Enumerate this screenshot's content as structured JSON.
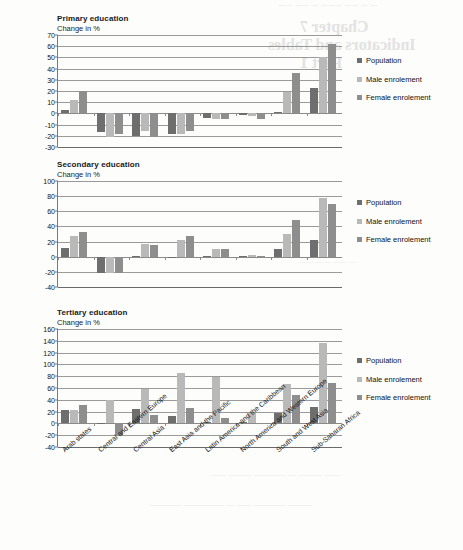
{
  "bleed_text": {
    "top_strip": "— — —— ——— — —— ——",
    "line1": "Chapter 7",
    "line2": "Indicators and Tables",
    "line3": "Part 1",
    "middle": "— —— — — ——",
    "bottom1": "—— ——— — ———— ——— ——",
    "bottom2": "——— ———— —— — ————— ————"
  },
  "legend": {
    "items": [
      {
        "label": "Population",
        "color": "#6e6e6e"
      },
      {
        "label": "Male enrolement",
        "color": "#b9b9b9"
      },
      {
        "label": "Female enrolement",
        "color": "#8e8e8e"
      }
    ]
  },
  "categories": [
    "Arab states",
    "Central and Eastern Europe",
    "Central Asia",
    "East Asia and the Pacific",
    "Latin America and the Caribbean",
    "North America and Western Europe",
    "South and West Asia",
    "Sub-Saharan Africa"
  ],
  "chart_data": [
    {
      "type": "bar",
      "title": "Primary education",
      "subtitle": "Change in %",
      "xlabel": "",
      "ylabel": "Change in %",
      "ylim": [
        -30,
        70
      ],
      "yticks": [
        70,
        60,
        50,
        40,
        30,
        20,
        10,
        0,
        -10,
        -20,
        -30
      ],
      "grid": true,
      "legend_position": "right",
      "categories": [
        "Arab states",
        "Central and Eastern Europe",
        "Central Asia",
        "East Asia and the Pacific",
        "Latin America and the Caribbean",
        "North America and Western Europe",
        "South and West Asia",
        "Sub-Saharan Africa"
      ],
      "series": [
        {
          "name": "Population",
          "values": [
            3,
            -17,
            -20,
            -18,
            -4,
            -1,
            1,
            23
          ]
        },
        {
          "name": "Male enrolement",
          "values": [
            12,
            -21,
            -16,
            -18,
            -5,
            -2,
            19,
            50
          ]
        },
        {
          "name": "Female enrolement",
          "values": [
            20,
            -18,
            -21,
            -16,
            -5,
            -5,
            36,
            62
          ]
        }
      ]
    },
    {
      "type": "bar",
      "title": "Secondary education",
      "subtitle": "Change in %",
      "xlabel": "",
      "ylabel": "Change in %",
      "ylim": [
        -40,
        100
      ],
      "yticks": [
        100,
        80,
        60,
        40,
        20,
        0,
        -20,
        -40
      ],
      "grid": true,
      "legend_position": "right",
      "categories": [
        "Arab states",
        "Central and Eastern Europe",
        "Central Asia",
        "East Asia and the Pacific",
        "Latin America and the Caribbean",
        "North America and Western Europe",
        "South and West Asia",
        "Sub-Saharan Africa"
      ],
      "series": [
        {
          "name": "Population",
          "values": [
            12,
            -22,
            1,
            0,
            1,
            1,
            10,
            22
          ]
        },
        {
          "name": "Male enrolement",
          "values": [
            28,
            -21,
            17,
            22,
            10,
            2,
            30,
            78
          ]
        },
        {
          "name": "Female enrolement",
          "values": [
            32,
            -21,
            15,
            27,
            10,
            1,
            49,
            69
          ]
        }
      ]
    },
    {
      "type": "bar",
      "title": "Tertiary education",
      "subtitle": "Change in %",
      "xlabel": "",
      "ylabel": "Change in %",
      "ylim": [
        -40,
        160
      ],
      "yticks": [
        160,
        140,
        120,
        100,
        80,
        60,
        40,
        20,
        0,
        -20,
        -40
      ],
      "grid": true,
      "legend_position": "right",
      "categories": [
        "Arab states",
        "Central and Eastern Europe",
        "Central Asia",
        "East Asia and the Pacific",
        "Latin America and the Caribbean",
        "North America and Western Europe",
        "South and West Asia",
        "Sub-Saharan Africa"
      ],
      "series": [
        {
          "name": "Population",
          "values": [
            23,
            0,
            24,
            12,
            2,
            2,
            17,
            28
          ]
        },
        {
          "name": "Male enrolement",
          "values": [
            23,
            39,
            58,
            85,
            78,
            17,
            66,
            136
          ]
        },
        {
          "name": "Female enrolement",
          "values": [
            31,
            -22,
            14,
            26,
            10,
            0,
            48,
            68
          ]
        }
      ]
    }
  ]
}
